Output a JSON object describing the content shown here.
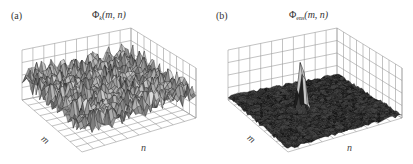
{
  "figure": {
    "panels": [
      {
        "label": "(a)",
        "title_symbol": "Φ",
        "title_subscript": "k",
        "title_args": "(m, n)",
        "axis_labels": {
          "x": "n",
          "y": "m"
        },
        "description": "Noisy 3D surface mesh with many random peaks"
      },
      {
        "label": "(b)",
        "title_symbol": "Φ",
        "title_subscript": "ens",
        "title_args": "(m, n)",
        "axis_labels": {
          "x": "n",
          "y": "m"
        },
        "description": "Flat low-noise 3D surface mesh with a single sharp central peak"
      }
    ]
  },
  "chart_data": [
    {
      "type": "surface",
      "title": "Φk(m, n)",
      "panel": "(a)",
      "xlabel": "n",
      "ylabel": "m",
      "zlabel": "",
      "grid": true,
      "description": "Random speckle-like surface; peaks of comparable heights distributed across the whole (m,n) plane"
    },
    {
      "type": "surface",
      "title": "Φens(m, n)",
      "panel": "(b)",
      "xlabel": "n",
      "ylabel": "m",
      "zlabel": "",
      "grid": true,
      "description": "Ensemble-averaged surface; nearly flat background with one narrow dominant peak near the center"
    }
  ],
  "colors": {
    "grid": "#9a9a9a",
    "mesh_dark": "#1a1a1a",
    "mesh_light": "#d0d0d0",
    "text": "#333333"
  }
}
